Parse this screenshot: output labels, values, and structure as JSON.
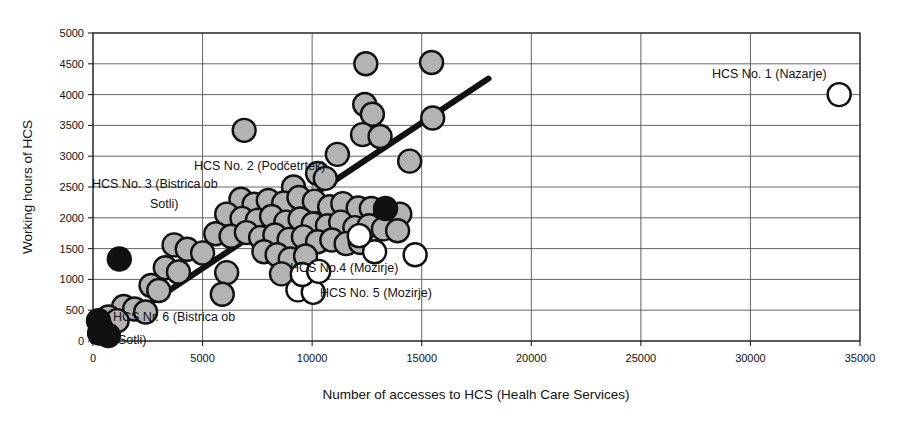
{
  "chart_data": {
    "type": "scatter",
    "title": "",
    "xlabel": "Number of accesses to HCS (Healh Care Services)",
    "ylabel": "Working hours of HCS",
    "xlim": [
      0,
      35000
    ],
    "ylim": [
      0,
      5000
    ],
    "xticks": [
      0,
      5000,
      10000,
      15000,
      20000,
      25000,
      30000,
      35000
    ],
    "xtick_labels": [
      "0",
      "5000",
      "10000",
      "15000",
      "20000",
      "25000",
      "30000",
      "35000"
    ],
    "yticks": [
      0,
      500,
      1000,
      1500,
      2000,
      2500,
      3000,
      3500,
      4000,
      4500,
      5000
    ],
    "ytick_labels": [
      "0",
      "500",
      "1000",
      "1500",
      "2000",
      "2500",
      "3000",
      "3500",
      "4000",
      "4500",
      "5000"
    ],
    "grid": true,
    "legend": "none",
    "marker_style": {
      "shape": "circle",
      "diameter_px": 23,
      "fill_gray": "#b3b3b3",
      "fill_black": "#111111",
      "fill_white": "#ffffff",
      "edge": "#111111",
      "edge_width_px": 2.4
    },
    "trendline": {
      "type": "linear",
      "x_start": 0,
      "y_start": 0,
      "x_end": 18050,
      "y_end": 4260,
      "color": "#111111",
      "width_px": 6
    },
    "series": [
      {
        "name": "HCS units (gray)",
        "fill": "gray",
        "points": [
          [
            6900,
            3420
          ],
          [
            12450,
            4500
          ],
          [
            15450,
            4520
          ],
          [
            12400,
            3840
          ],
          [
            12750,
            3680
          ],
          [
            15500,
            3620
          ],
          [
            12300,
            3350
          ],
          [
            13100,
            3320
          ],
          [
            11150,
            3030
          ],
          [
            14450,
            2920
          ],
          [
            10250,
            2720
          ],
          [
            10600,
            2640
          ],
          [
            9150,
            2500
          ],
          [
            6750,
            2300
          ],
          [
            7350,
            2220
          ],
          [
            8000,
            2280
          ],
          [
            8700,
            2240
          ],
          [
            9400,
            2330
          ],
          [
            10100,
            2270
          ],
          [
            10800,
            2180
          ],
          [
            11400,
            2230
          ],
          [
            12100,
            2160
          ],
          [
            12700,
            2150
          ],
          [
            13350,
            2090
          ],
          [
            14000,
            2060
          ],
          [
            6100,
            2060
          ],
          [
            6800,
            1990
          ],
          [
            7500,
            1960
          ],
          [
            8150,
            2020
          ],
          [
            8800,
            1930
          ],
          [
            9450,
            1980
          ],
          [
            10050,
            1900
          ],
          [
            10700,
            1870
          ],
          [
            11300,
            1930
          ],
          [
            11950,
            1840
          ],
          [
            12600,
            1870
          ],
          [
            13250,
            1820
          ],
          [
            13900,
            1790
          ],
          [
            5600,
            1740
          ],
          [
            6300,
            1700
          ],
          [
            7000,
            1760
          ],
          [
            7650,
            1680
          ],
          [
            8300,
            1720
          ],
          [
            8950,
            1650
          ],
          [
            9600,
            1690
          ],
          [
            10250,
            1610
          ],
          [
            10900,
            1640
          ],
          [
            11550,
            1580
          ],
          [
            12200,
            1600
          ],
          [
            3700,
            1560
          ],
          [
            4300,
            1490
          ],
          [
            5000,
            1430
          ],
          [
            7800,
            1450
          ],
          [
            8400,
            1400
          ],
          [
            9000,
            1330
          ],
          [
            9700,
            1380
          ],
          [
            3300,
            1190
          ],
          [
            3900,
            1120
          ],
          [
            6100,
            1110
          ],
          [
            8600,
            1090
          ],
          [
            2650,
            900
          ],
          [
            3000,
            820
          ],
          [
            5900,
            760
          ],
          [
            1400,
            560
          ],
          [
            1900,
            520
          ],
          [
            2400,
            470
          ],
          [
            700,
            390
          ],
          [
            1100,
            330
          ],
          [
            350,
            220
          ]
        ]
      },
      {
        "name": "HCS units (black)",
        "fill": "black",
        "points": [
          [
            1200,
            1330
          ],
          [
            13350,
            2150
          ],
          [
            300,
            130
          ],
          [
            700,
            90
          ],
          [
            250,
            330
          ]
        ]
      },
      {
        "name": "HCS units (white)",
        "fill": "white",
        "points": [
          [
            34050,
            4000
          ],
          [
            14700,
            1400
          ],
          [
            12850,
            1450
          ],
          [
            12150,
            1710
          ],
          [
            9350,
            830
          ],
          [
            10050,
            790
          ],
          [
            9550,
            1080
          ],
          [
            10300,
            1130
          ]
        ]
      }
    ],
    "annotations": [
      {
        "id": "hcs-1",
        "text": "HCS No. 1 (Nazarje)",
        "x_px": 712,
        "y_px": 78,
        "anchor": "start"
      },
      {
        "id": "hcs-2",
        "text": "HCS No. 2 (Podčetrtek)",
        "x_px": 194,
        "y_px": 170,
        "anchor": "start"
      },
      {
        "id": "hcs-3a",
        "text": "HCS No. 3 (Bistrica ob",
        "x_px": 92,
        "y_px": 188,
        "anchor": "start"
      },
      {
        "id": "hcs-3b",
        "text": "Sotli)",
        "x_px": 150,
        "y_px": 208,
        "anchor": "start"
      },
      {
        "id": "hcs-4",
        "text": "HCS No.4 (Mozirje)",
        "x_px": 290,
        "y_px": 272,
        "anchor": "start"
      },
      {
        "id": "hcs-5",
        "text": "HCS No. 5 (Mozirje)",
        "x_px": 320,
        "y_px": 297,
        "anchor": "start"
      },
      {
        "id": "hcs-6a",
        "text": "HCS Nr. 6 (Bistrica ob",
        "x_px": 113,
        "y_px": 321,
        "anchor": "start"
      },
      {
        "id": "hcs-6b",
        "text": "Sotli)",
        "x_px": 118,
        "y_px": 344,
        "anchor": "start"
      }
    ]
  }
}
